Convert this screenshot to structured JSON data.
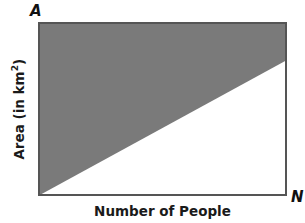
{
  "diagram": {
    "corner_labels": {
      "top_left": "A",
      "bottom_right": "N"
    },
    "x_axis_label": "Number of People",
    "y_axis_label": {
      "prefix": "Area (in km",
      "superscript": "2",
      "suffix": ")"
    },
    "colors": {
      "shaded_region": "#7a7a7a",
      "frame": "#555555",
      "background": "#ffffff"
    },
    "regions": [
      {
        "name": "shaded",
        "description": "Region above diagonal line from origin to right edge"
      },
      {
        "name": "unshaded",
        "description": "Triangle below diagonal line"
      }
    ],
    "diagonal_line": {
      "from": "bottom-left corner",
      "to": "right edge at ~22% down from top"
    }
  }
}
